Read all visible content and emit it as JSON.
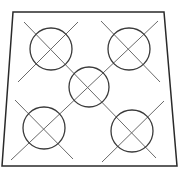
{
  "diagram": {
    "width": 181,
    "height": 176,
    "colors": {
      "background": "#ffffff",
      "frame": "#2a2a2a",
      "circle": "#3a3a3a",
      "line": "#6a6a6a"
    },
    "frame": {
      "points": [
        [
          13,
          12
        ],
        [
          164,
          12
        ],
        [
          177,
          166
        ],
        [
          2,
          166
        ]
      ]
    },
    "circles": [
      {
        "id": "top-left",
        "cx": 51,
        "cy": 49,
        "r": 21
      },
      {
        "id": "top-right",
        "cx": 129,
        "cy": 49,
        "r": 21
      },
      {
        "id": "center",
        "cx": 89,
        "cy": 87,
        "r": 20
      },
      {
        "id": "bottom-left",
        "cx": 44,
        "cy": 128,
        "r": 21
      },
      {
        "id": "bottom-right",
        "cx": 132,
        "cy": 131,
        "r": 21
      }
    ],
    "lines": [
      {
        "id": "main-diagonal",
        "x1": 24,
        "y1": 22,
        "x2": 156,
        "y2": 158
      },
      {
        "id": "anti-diagonal",
        "x1": 158,
        "y1": 21,
        "x2": 11,
        "y2": 160
      },
      {
        "id": "top-left-cross",
        "x1": 78,
        "y1": 22,
        "x2": 18,
        "y2": 82
      },
      {
        "id": "top-right-cross",
        "x1": 101,
        "y1": 21,
        "x2": 160,
        "y2": 82
      },
      {
        "id": "bottom-left-cross",
        "x1": 15,
        "y1": 100,
        "x2": 73,
        "y2": 159
      },
      {
        "id": "bottom-right-cross",
        "x1": 164,
        "y1": 101,
        "x2": 102,
        "y2": 162
      }
    ]
  }
}
